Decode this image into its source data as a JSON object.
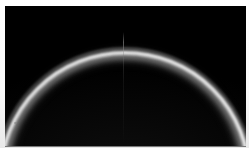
{
  "image": {
    "subject": "bright circular limb arc on black field",
    "kind": "astronomical-plate-scan",
    "width_px": 249,
    "height_px": 148,
    "alt_text": "Upper portion of a large bright circular limb arcing across a black field",
    "background_color": "#000000",
    "border_color": "#ffffff",
    "limb_color": "#f4f4f4",
    "glow_color": "#cdcdcd"
  },
  "frame": {
    "margin_top_px": 6,
    "margin_left_px": 5,
    "margin_right_px": 3,
    "margin_bottom_px": 1
  },
  "features": {
    "limb": {
      "label": "limb-arc",
      "center_x_px": 123,
      "center_y_px": 168,
      "radius_px": 126,
      "band_width_px": 8,
      "apex_x_px": 123,
      "apex_y_px": 42,
      "left_exit_x_px": 45,
      "right_exit_x_px": 200,
      "peak_brightness": 244
    },
    "column_artifact": {
      "label": "ccd-column-bleed",
      "x_px": 123,
      "top_y_px": 32,
      "length_px": 114
    },
    "dust_speck": {
      "label": "plate-dust-speck",
      "x_px": 9,
      "y_px": 116,
      "brightness": 128
    }
  }
}
